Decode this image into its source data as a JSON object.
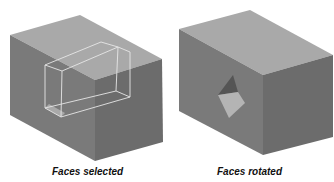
{
  "figures": [
    {
      "caption": "Faces selected",
      "colors": {
        "top": "#a9a9a9",
        "front": "#7a7a7a",
        "side": "#6c6c6c",
        "wire": "#e6e6e6"
      }
    },
    {
      "caption": "Faces rotated",
      "colors": {
        "top": "#a9a9a9",
        "front": "#7a7a7a",
        "side": "#6c6c6c",
        "diamond_dark": "#555555",
        "diamond_light": "#b4b4b4"
      }
    }
  ]
}
